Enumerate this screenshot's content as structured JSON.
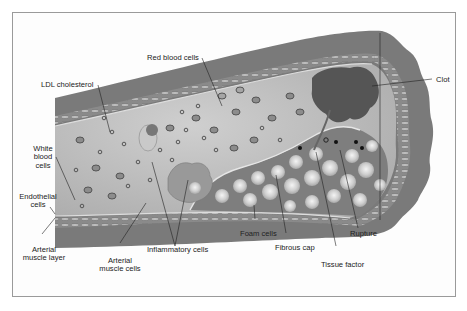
{
  "diagram": {
    "type": "anatomical-illustration",
    "labels": {
      "red_blood_cells": "Red blood cells",
      "ldl_cholesterol": "LDL cholesterol",
      "white_blood_cells_1": "White",
      "white_blood_cells_2": "blood",
      "white_blood_cells_3": "cells",
      "endothelial_cells_1": "Endothelial",
      "endothelial_cells_2": "cells",
      "arterial_muscle_layer_1": "Arterial",
      "arterial_muscle_layer_2": "muscle layer",
      "arterial_muscle_cells_1": "Arterial",
      "arterial_muscle_cells_2": "muscle cells",
      "inflammatory_cells": "Inflammatory cells",
      "foam_cells": "Foam cells",
      "fibrous_cap": "Fibrous cap",
      "tissue_factor": "Tissue factor",
      "rupture": "Rupture",
      "clot": "Clot"
    },
    "colors": {
      "vessel_wall": "#7d7d7d",
      "lumen": "#b9b9b9",
      "plaque": "#8f8f8f",
      "clot": "#5a5a5a",
      "foam_cell": "#d8d8d8",
      "frame": "#9a9a9a"
    }
  }
}
